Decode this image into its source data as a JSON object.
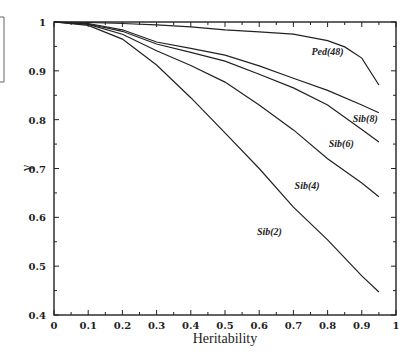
{
  "chart_data": {
    "type": "line",
    "title": "",
    "xlabel": "Heritability",
    "ylabel": "γ",
    "xlim": [
      0,
      1
    ],
    "ylim": [
      0.4,
      1
    ],
    "grid": false,
    "x_ticks": [
      "0",
      "0.1",
      "0.2",
      "0.3",
      "0.4",
      "0.5",
      "0.6",
      "0.7",
      "0.8",
      "0.9",
      "1"
    ],
    "y_ticks": [
      "0.4",
      "0.5",
      "0.6",
      "0.7",
      "0.8",
      "0.9",
      "1"
    ],
    "series": [
      {
        "name": "Ped(48)",
        "x": [
          0,
          0.1,
          0.2,
          0.3,
          0.4,
          0.5,
          0.6,
          0.7,
          0.8,
          0.85,
          0.9,
          0.95
        ],
        "values": [
          1.0,
          0.999,
          0.997,
          0.994,
          0.99,
          0.984,
          0.98,
          0.975,
          0.962,
          0.949,
          0.926,
          0.871
        ]
      },
      {
        "name": "Sib(8)",
        "x": [
          0,
          0.1,
          0.2,
          0.3,
          0.4,
          0.5,
          0.6,
          0.7,
          0.8,
          0.9,
          0.95
        ],
        "values": [
          1.0,
          0.997,
          0.984,
          0.959,
          0.946,
          0.932,
          0.91,
          0.885,
          0.86,
          0.83,
          0.814
        ]
      },
      {
        "name": "Sib(6)",
        "x": [
          0,
          0.1,
          0.2,
          0.3,
          0.4,
          0.5,
          0.6,
          0.7,
          0.8,
          0.9,
          0.95
        ],
        "values": [
          1.0,
          0.996,
          0.981,
          0.955,
          0.938,
          0.92,
          0.893,
          0.865,
          0.83,
          0.78,
          0.754
        ]
      },
      {
        "name": "Sib(4)",
        "x": [
          0,
          0.1,
          0.2,
          0.3,
          0.4,
          0.5,
          0.6,
          0.7,
          0.8,
          0.9,
          0.95
        ],
        "values": [
          1.0,
          0.995,
          0.975,
          0.941,
          0.911,
          0.877,
          0.83,
          0.779,
          0.72,
          0.67,
          0.642
        ]
      },
      {
        "name": "Sib(2)",
        "x": [
          0,
          0.1,
          0.2,
          0.3,
          0.4,
          0.5,
          0.6,
          0.7,
          0.8,
          0.9,
          0.95
        ],
        "values": [
          1.0,
          0.993,
          0.965,
          0.912,
          0.845,
          0.773,
          0.7,
          0.621,
          0.554,
          0.48,
          0.447
        ]
      }
    ],
    "annotations": [
      {
        "text": "Ped(48)",
        "x": 0.8,
        "y": 0.932
      },
      {
        "text": "Sib(8)",
        "x": 0.91,
        "y": 0.795
      },
      {
        "text": "Sib(6)",
        "x": 0.84,
        "y": 0.745
      },
      {
        "text": "Sib(4)",
        "x": 0.74,
        "y": 0.659
      },
      {
        "text": "Sib(2)",
        "x": 0.63,
        "y": 0.563
      }
    ],
    "legend": "none"
  }
}
